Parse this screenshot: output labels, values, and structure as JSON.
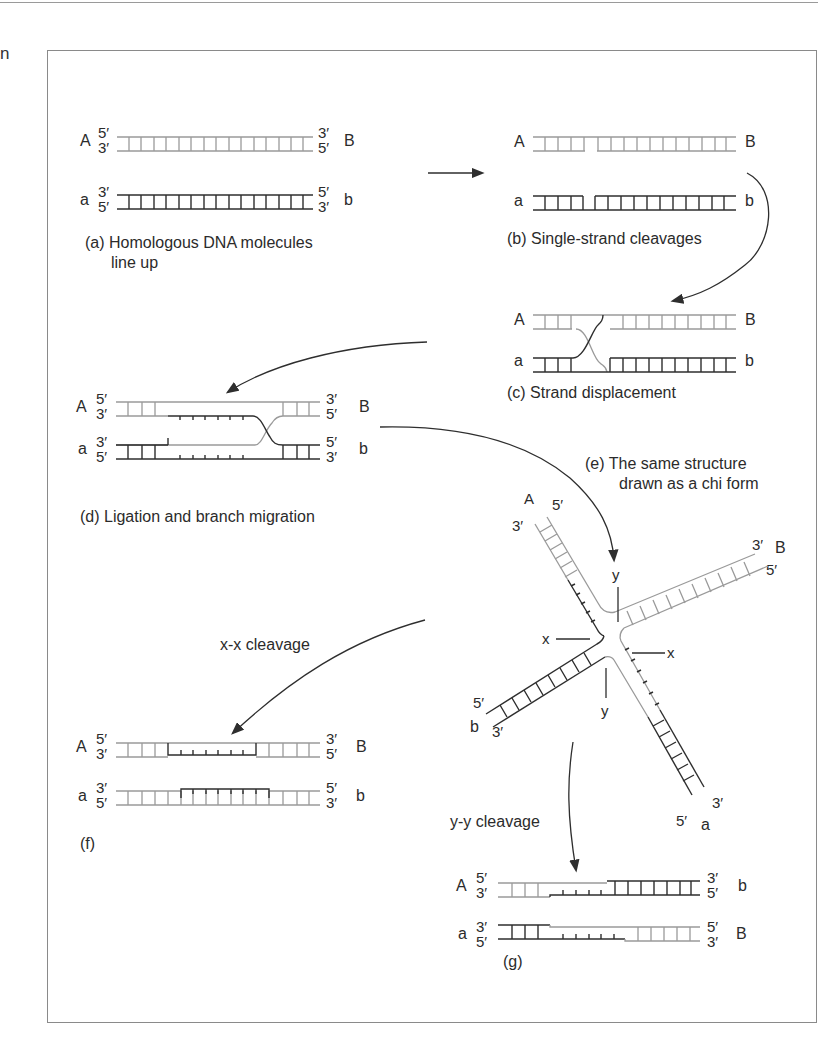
{
  "edge_fragment": "n",
  "panels": {
    "a": {
      "caption_line1": "(a) Homologous DNA molecules",
      "caption_line2": "line up",
      "top": {
        "left_name": "A",
        "left_top": "5′",
        "left_bot": "3′",
        "right_top": "3′",
        "right_bot": "5′",
        "right_name": "B"
      },
      "bottom": {
        "left_name": "a",
        "left_top": "3′",
        "left_bot": "5′",
        "right_top": "5′",
        "right_bot": "3′",
        "right_name": "b"
      }
    },
    "b": {
      "caption": "(b) Single-strand cleavages",
      "top_left": "A",
      "top_right": "B",
      "bot_left": "a",
      "bot_right": "b"
    },
    "c": {
      "caption": "(c) Strand displacement",
      "top_left": "A",
      "top_right": "B",
      "bot_left": "a",
      "bot_right": "b"
    },
    "d": {
      "caption": "(d) Ligation and branch migration",
      "top": {
        "left_name": "A",
        "left_top": "5′",
        "left_bot": "3′",
        "right_top": "3′",
        "right_bot": "5′",
        "right_name": "B"
      },
      "bottom": {
        "left_name": "a",
        "left_top": "3′",
        "left_bot": "5′",
        "right_top": "5′",
        "right_bot": "3′",
        "right_name": "b"
      }
    },
    "e": {
      "caption_line1": "(e) The same structure",
      "caption_line2": "drawn as a chi form",
      "arm_ul": {
        "name": "A",
        "end1": "5′",
        "end2": "3′"
      },
      "arm_ur": {
        "name": "B",
        "end1": "3′",
        "end2": "5′"
      },
      "arm_ll": {
        "name": "b",
        "end1": "5′",
        "end2": "3′"
      },
      "arm_lr": {
        "name": "a",
        "end1": "5′",
        "end2": "3′"
      },
      "cut_x": "x",
      "cut_y": "y"
    },
    "f": {
      "caption": "(f)",
      "arrow_label": "x-x cleavage",
      "top": {
        "left_name": "A",
        "left_top": "5′",
        "left_bot": "3′",
        "right_top": "3′",
        "right_bot": "5′",
        "right_name": "B"
      },
      "bottom": {
        "left_name": "a",
        "left_top": "3′",
        "left_bot": "5′",
        "right_top": "5′",
        "right_bot": "3′",
        "right_name": "b"
      }
    },
    "g": {
      "caption": "(g)",
      "arrow_label": "y-y cleavage",
      "top": {
        "left_name": "A",
        "left_top": "5′",
        "left_bot": "3′",
        "right_top": "3′",
        "right_bot": "5′",
        "right_name": "b"
      },
      "bottom": {
        "left_name": "a",
        "left_top": "3′",
        "left_bot": "5′",
        "right_top": "5′",
        "right_bot": "3′",
        "right_name": "B"
      }
    }
  },
  "colors": {
    "light_strand": "#9a9a9a",
    "dark_strand": "#2e2e2e",
    "frame": "#8a8a8a"
  }
}
